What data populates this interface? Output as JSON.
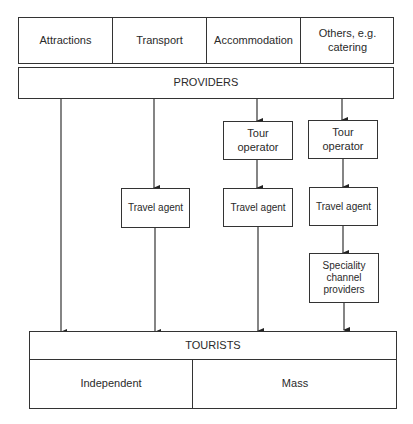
{
  "diagram": {
    "sectors": [
      {
        "label": "Attractions"
      },
      {
        "label": "Transport"
      },
      {
        "label": "Accommodation"
      },
      {
        "label": "Others, e.g.\ncatering"
      }
    ],
    "providers": {
      "label": "PROVIDERS"
    },
    "channels": [
      {
        "path": [
          "PROVIDERS",
          "TOURISTS"
        ]
      },
      {
        "path": [
          "PROVIDERS",
          "Travel agent",
          "TOURISTS"
        ]
      },
      {
        "path": [
          "PROVIDERS",
          "Tour operator",
          "Travel agent",
          "TOURISTS"
        ]
      },
      {
        "path": [
          "PROVIDERS",
          "Tour operator",
          "Travel agent",
          "Speciality channel providers",
          "TOURISTS"
        ]
      }
    ],
    "intermediaries": {
      "tour_operator_1": "Tour\noperator",
      "tour_operator_2": "Tour\noperator",
      "travel_agent_1": "Travel agent",
      "travel_agent_2": "Travel agent",
      "travel_agent_3": "Travel agent",
      "speciality": "Speciality\nchannel\nproviders"
    },
    "tourists": {
      "label": "TOURISTS",
      "segments": [
        {
          "label": "Independent"
        },
        {
          "label": "Mass"
        }
      ]
    }
  }
}
